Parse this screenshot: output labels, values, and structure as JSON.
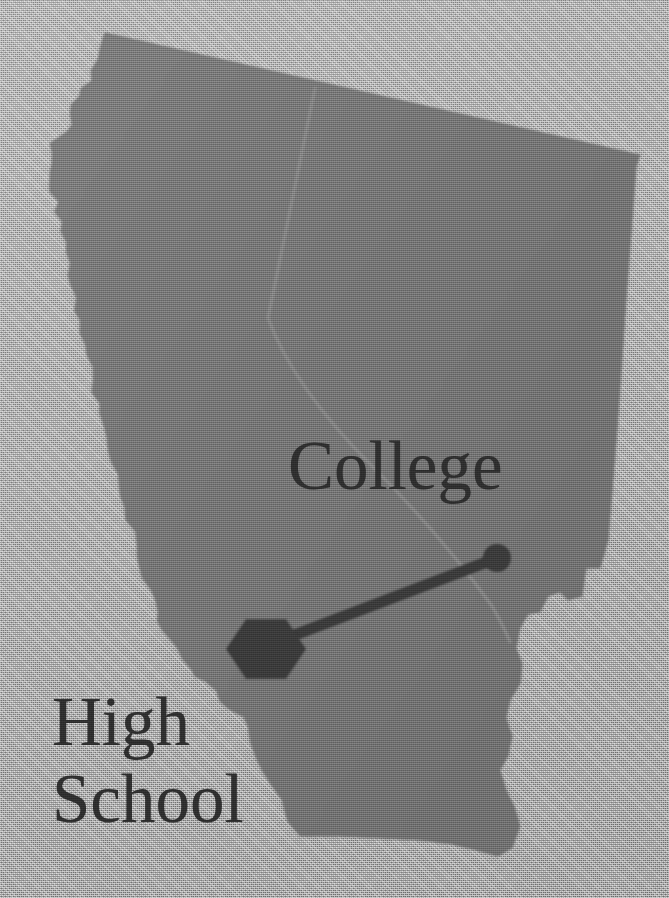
{
  "figure": {
    "kind": "thematic-map",
    "width": 669,
    "height": 898,
    "background_color": "#b6b6b6",
    "land_fill_color": "#767676",
    "internal_border_color": "#8f8f8f",
    "marker_color": "#3a3a3a",
    "label_color": "#2f2f2f"
  },
  "labels": {
    "college": "College",
    "high_school_line1": "High",
    "high_school_line2": "School"
  },
  "markers": [
    {
      "id": "high-school-marker",
      "shape": "hexagon",
      "label": "High School",
      "cx": 266,
      "cy": 649,
      "size": 40,
      "color": "#3a3a3a"
    },
    {
      "id": "college-marker",
      "shape": "circle",
      "label": "College",
      "cx": 497,
      "cy": 558,
      "radius": 14,
      "color": "#3a3a3a"
    }
  ],
  "connector": {
    "id": "high-school-to-college-link",
    "from": "high-school-marker",
    "to": "college-marker",
    "x1": 292,
    "y1": 636,
    "x2": 492,
    "y2": 560,
    "width": 11,
    "color": "#3a3a3a"
  },
  "geometry": {
    "land_path": "M 105,33 L 640,155 L 636,167 L 626,300 L 617,430 L 608,540 L 600,568 L 586,568 L 582,596 L 568,600 L 560,592 L 548,596 L 540,612 L 528,614 L 520,628 L 516,648 L 522,664 L 520,684 L 510,700 L 506,718 L 512,736 L 508,756 L 500,770 L 506,790 L 514,806 L 520,826 L 512,848 L 498,856 L 476,850 L 452,844 L 420,840 L 380,838 L 340,836 L 300,836 L 288,822 L 282,800 L 272,786 L 262,770 L 254,756 L 250,742 L 246,726 L 240,716 L 232,708 L 222,702 L 212,692 L 206,682 L 198,676 L 188,670 L 180,660 L 176,648 L 172,638 L 166,630 L 160,622 L 156,612 L 152,600 L 148,590 L 146,578 L 142,566 L 138,556 L 134,544 L 132,532 L 128,520 L 124,508 L 122,496 L 118,486 L 116,474 L 112,462 L 110,450 L 106,438 L 104,426 L 100,414 L 97,404 L 95,392 L 92,380 L 89,368 L 87,356 L 84,344 L 82,334 L 79,322 L 76,310 L 74,298 L 72,286 L 70,276 L 67,264 L 65,252 L 63,242 L 61,232 L 59,222 L 57,212 L 56,202 L 54,192 L 53,182 L 52,172 L 51,162 L 50,152 L 52,144 L 58,138 L 64,132 L 68,124 L 70,114 L 72,104 L 76,96 L 82,88 L 88,80 L 94,70 L 98,60 L 100,50 L 102,42 Z",
    "coast_detail_note": "west coast rendered with jagged micro-indentations",
    "internal_border_path": "M 315,88 C 300,160 284,240 268,318 C 288,372 330,424 372,466 C 414,508 456,556 492,606 C 500,620 506,632 510,642"
  }
}
